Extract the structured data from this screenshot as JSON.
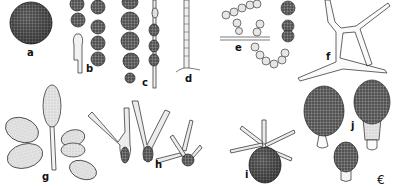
{
  "figure": {
    "type": "scientific illustration plate",
    "background": "#ffffff",
    "ink": "#222222",
    "panels": [
      {
        "id": "a",
        "label": "a",
        "description": "single globose dark stippled spore"
      },
      {
        "id": "b",
        "label": "b",
        "description": "chains of globose cells on hypha"
      },
      {
        "id": "c",
        "label": "c",
        "description": "chains of rounded cells, stippled"
      },
      {
        "id": "d",
        "label": "d",
        "description": "thin septate hypha with small cells"
      },
      {
        "id": "e",
        "label": "e",
        "description": "branched chains of pale cells with dark globose cells"
      },
      {
        "id": "f",
        "label": "f",
        "description": "branched septate hyphae"
      },
      {
        "id": "g",
        "label": "g",
        "description": "ellipsoid conidia on branched stalk"
      },
      {
        "id": "h",
        "label": "h",
        "description": "septate branched conidia (staurospores)"
      },
      {
        "id": "i",
        "label": "i",
        "description": "dark globose cell with radiating septate arms"
      },
      {
        "id": "j",
        "label": "j",
        "description": "ovoid dark conidia with pale basal cells"
      }
    ],
    "signature": "€"
  }
}
